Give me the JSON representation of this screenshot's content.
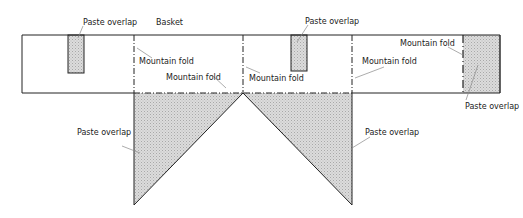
{
  "diagram": {
    "title": "Basket",
    "labels": {
      "paste_overlap_tab_left": "Paste overlap",
      "basket": "Basket",
      "mountain_fold_1": "Mountain fold",
      "mountain_fold_2": "Mountain fold",
      "paste_overlap_tab_mid": "Paste overlap",
      "mountain_fold_3": "Mountain fold",
      "mountain_fold_4": "Mountain fold",
      "mountain_fold_5": "Mountain fold",
      "paste_overlap_end": "Paste overlap",
      "paste_overlap_triangle_left": "Paste overlap",
      "paste_overlap_triangle_right": "Paste overlap"
    },
    "colors": {
      "line": "#222222",
      "shade": "#d4d4d4",
      "leader": "#888888"
    }
  }
}
